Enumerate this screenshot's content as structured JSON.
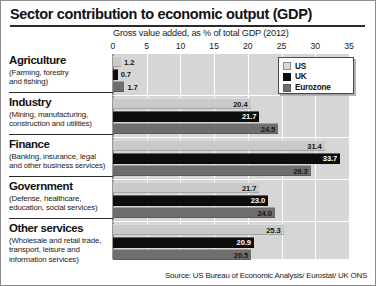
{
  "chart_data": {
    "type": "bar",
    "orientation": "horizontal",
    "title": "Sector contribution to economic output (GDP)",
    "subtitle": "Gross value added, as % of total GDP (2012)",
    "xlabel": "",
    "ylabel": "",
    "xlim": [
      0,
      35
    ],
    "xticks": [
      0,
      5,
      10,
      15,
      20,
      25,
      30,
      35
    ],
    "grid": true,
    "legend_position": "top-right",
    "categories": [
      "Agriculture",
      "Industry",
      "Finance",
      "Government",
      "Other services"
    ],
    "category_descriptions": [
      "(Farming, forestry and fishing)",
      "(Mining, manufacturing, construction and utilities)",
      "(Banking, insurance, legal and other business services)",
      "(Defense, healthcare, education, social services)",
      "(Wholesale and retail trade, transport, leisure and information services)"
    ],
    "series": [
      {
        "name": "US",
        "color": "#c9c9c9",
        "values": [
          1.2,
          20.4,
          31.4,
          21.7,
          25.3
        ]
      },
      {
        "name": "UK",
        "color": "#0d0d0d",
        "values": [
          0.7,
          21.7,
          33.7,
          23.0,
          20.9
        ]
      },
      {
        "name": "Eurozone",
        "color": "#6e6e6e",
        "values": [
          1.7,
          24.5,
          29.3,
          24.0,
          20.5
        ]
      }
    ],
    "source": "Source: US Bureau of Economic Analysis/ Eurostat/ UK ONS"
  },
  "header": {
    "title": "Sector contribution to economic output (GDP)"
  },
  "axis": {
    "subtitle": "Gross value added, as % of total GDP (2012)",
    "ticks": [
      "0",
      "5",
      "10",
      "15",
      "20",
      "25",
      "30",
      "35"
    ]
  },
  "legend": {
    "items": [
      {
        "label": "US"
      },
      {
        "label": "UK"
      },
      {
        "label": "Eurozone"
      }
    ]
  },
  "groups": [
    {
      "name": "Agriculture",
      "description_lines": [
        "(Farming, forestry",
        "and fishing)"
      ],
      "bars": [
        {
          "series": "US",
          "value": 1.2,
          "label": "1.2"
        },
        {
          "series": "UK",
          "value": 0.7,
          "label": "0.7"
        },
        {
          "series": "Eurozone",
          "value": 1.7,
          "label": "1.7"
        }
      ]
    },
    {
      "name": "Industry",
      "description_lines": [
        "(Mining, manufacturing,",
        "construction and utilities)"
      ],
      "bars": [
        {
          "series": "US",
          "value": 20.4,
          "label": "20.4"
        },
        {
          "series": "UK",
          "value": 21.7,
          "label": "21.7"
        },
        {
          "series": "Eurozone",
          "value": 24.5,
          "label": "24.5"
        }
      ]
    },
    {
      "name": "Finance",
      "description_lines": [
        "(Banking, insurance, legal",
        "and other business services)"
      ],
      "bars": [
        {
          "series": "US",
          "value": 31.4,
          "label": "31.4"
        },
        {
          "series": "UK",
          "value": 33.7,
          "label": "33.7"
        },
        {
          "series": "Eurozone",
          "value": 29.3,
          "label": "29.3"
        }
      ]
    },
    {
      "name": "Government",
      "description_lines": [
        "(Defense, healthcare,",
        "education, social services)"
      ],
      "bars": [
        {
          "series": "US",
          "value": 21.7,
          "label": "21.7"
        },
        {
          "series": "UK",
          "value": 23.0,
          "label": "23.0"
        },
        {
          "series": "Eurozone",
          "value": 24.0,
          "label": "24.0"
        }
      ]
    },
    {
      "name": "Other services",
      "description_lines": [
        "(Wholesale and retail trade,",
        "transport, leisure and",
        "information services)"
      ],
      "bars": [
        {
          "series": "US",
          "value": 25.3,
          "label": "25.3"
        },
        {
          "series": "UK",
          "value": 20.9,
          "label": "20.9"
        },
        {
          "series": "Eurozone",
          "value": 20.5,
          "label": "20.5"
        }
      ]
    }
  ],
  "footer": {
    "source": "Source: US Bureau of Economic Analysis/ Eurostat/ UK ONS"
  }
}
